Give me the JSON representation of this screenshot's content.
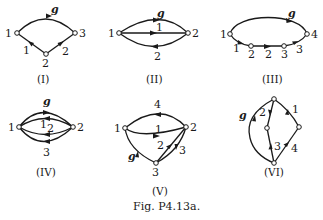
{
  "figure_caption": "Fig. P4.13a.",
  "graphs": [
    {
      "id": "I",
      "caption": "(I)",
      "nodes": [
        "1",
        "2",
        "3"
      ],
      "edges": [
        {
          "label": "g",
          "from": "1",
          "to": "3"
        },
        {
          "label": "1",
          "from": "2",
          "to": "1"
        },
        {
          "label": "2",
          "from": "2",
          "to": "3"
        }
      ]
    },
    {
      "id": "II",
      "caption": "(II)",
      "nodes": [
        "1",
        "2"
      ],
      "edges": [
        {
          "label": "g",
          "from": "1",
          "to": "2"
        },
        {
          "label": "1",
          "from": "1",
          "to": "2"
        },
        {
          "label": "2",
          "from": "2",
          "to": "1"
        }
      ]
    },
    {
      "id": "III",
      "caption": "(III)",
      "nodes": [
        "1",
        "2",
        "3",
        "4"
      ],
      "edges": [
        {
          "label": "g",
          "from": "1",
          "to": "4"
        },
        {
          "label": "1",
          "from": "1",
          "to": "2"
        },
        {
          "label": "2",
          "from": "2",
          "to": "3"
        },
        {
          "label": "3",
          "from": "3",
          "to": "4"
        }
      ]
    },
    {
      "id": "IV",
      "caption": "(IV)",
      "nodes": [
        "1",
        "2"
      ],
      "edges": [
        {
          "label": "g",
          "from": "1",
          "to": "2"
        },
        {
          "label": "1",
          "from": "2",
          "to": "1"
        },
        {
          "label": "2",
          "from": "2",
          "to": "1"
        },
        {
          "label": "3",
          "from": "2",
          "to": "1"
        }
      ]
    },
    {
      "id": "V",
      "caption": "(V)",
      "nodes": [
        "1",
        "2",
        "3"
      ],
      "edges": [
        {
          "label": "4",
          "from": "2",
          "to": "1"
        },
        {
          "label": "1",
          "from": "1",
          "to": "2"
        },
        {
          "label": "2",
          "from": "3",
          "to": "2"
        },
        {
          "label": "3",
          "from": "2",
          "to": "3"
        },
        {
          "label": "g",
          "from": "3",
          "to": "1"
        }
      ]
    },
    {
      "id": "VI",
      "caption": "(VI)",
      "nodes": [
        "top",
        "middle",
        "right",
        "bottom"
      ],
      "edges": [
        {
          "label": "g",
          "from": "bottom",
          "to": "top"
        },
        {
          "label": "2",
          "from": "top",
          "to": "middle"
        },
        {
          "label": "3",
          "from": "bottom",
          "to": "middle"
        },
        {
          "label": "1",
          "from": "right",
          "to": "top"
        },
        {
          "label": "4",
          "from": "bottom",
          "to": "right"
        }
      ]
    }
  ],
  "labels": {
    "I": {
      "n1": "1",
      "n2": "2",
      "n3": "3",
      "e_g": "g",
      "e1": "1",
      "e2": "2"
    },
    "II": {
      "n1": "1",
      "n2": "2",
      "e_g": "g",
      "e1": "1",
      "e2": "2"
    },
    "III": {
      "n1": "1",
      "n2": "2",
      "n3": "3",
      "n4": "4",
      "e_g": "g",
      "e1": "1",
      "e2": "2",
      "e3": "3"
    },
    "IV": {
      "n1": "1",
      "n2": "2",
      "e_g": "g",
      "e1": "1",
      "e2": "2",
      "e3": "3"
    },
    "V": {
      "n1": "1",
      "n2": "2",
      "n3": "3",
      "e_g": "g",
      "e1": "1",
      "e2": "2",
      "e3": "3",
      "e4": "4"
    },
    "VI": {
      "e_g": "g",
      "e1": "1",
      "e2": "2",
      "e3": "3",
      "e4": "4"
    }
  }
}
